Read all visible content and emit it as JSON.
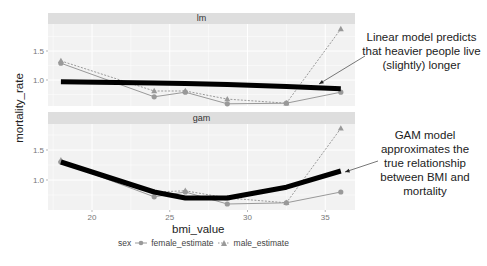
{
  "chart_data": {
    "type": "line",
    "title": "",
    "xlabel": "bmi_value",
    "ylabel": "mortality_rate",
    "x": [
      18,
      24,
      26,
      28.7,
      32.5,
      36
    ],
    "x_ticks": [
      20,
      25,
      30,
      35
    ],
    "y_ticks": [
      1.0,
      1.5
    ],
    "xlim": [
      17,
      37
    ],
    "grid": true,
    "legend": {
      "title": "sex",
      "position": "bottom",
      "entries": [
        "female_estimate",
        "male_estimate"
      ]
    },
    "facets": [
      {
        "label": "lm",
        "ylim": [
          0.55,
          1.95
        ],
        "series": [
          {
            "name": "female_estimate",
            "marker": "circle",
            "linestyle": "solid",
            "values": [
              1.29,
              0.71,
              0.79,
              0.59,
              0.6,
              0.79
            ]
          },
          {
            "name": "male_estimate",
            "marker": "triangle",
            "linestyle": "dashed",
            "values": [
              1.33,
              0.81,
              0.81,
              0.67,
              0.6,
              1.88
            ]
          },
          {
            "name": "model_fit",
            "linestyle": "thick",
            "values": [
              0.97,
              0.95,
              0.94,
              0.92,
              0.89,
              0.85
            ]
          }
        ]
      },
      {
        "label": "gam",
        "ylim": [
          0.55,
          1.95
        ],
        "series": [
          {
            "name": "female_estimate",
            "marker": "circle",
            "linestyle": "solid",
            "values": [
              1.3,
              0.72,
              0.8,
              0.6,
              0.62,
              0.8
            ]
          },
          {
            "name": "male_estimate",
            "marker": "triangle",
            "linestyle": "dashed",
            "values": [
              1.33,
              0.8,
              0.82,
              0.7,
              0.62,
              1.86
            ]
          },
          {
            "name": "model_fit",
            "linestyle": "thick",
            "values": [
              1.3,
              0.8,
              0.7,
              0.7,
              0.88,
              1.15
            ]
          }
        ]
      }
    ],
    "annotations": [
      {
        "text": "Linear model predicts that heavier people live (slightly) longer",
        "points_to": "lm fit line"
      },
      {
        "text": "GAM model approximates the true relationship between BMI and mortality",
        "points_to": "gam fit line"
      }
    ]
  },
  "labels": {
    "facet_top": "lm",
    "facet_bottom": "gam",
    "xlabel": "bmi_value",
    "ylabel": "mortality_rate",
    "legend_title": "sex",
    "legend_female": "female_estimate",
    "legend_male": "male_estimate",
    "annot_lm": "Linear model predicts that heavier people live (slightly) longer",
    "annot_gam": "GAM model approximates the true relationship between BMI and mortality"
  },
  "colors": {
    "panel_bg": "#f2f2f2",
    "strip_bg": "#dedede",
    "grid": "#ffffff",
    "points": "#999999",
    "fit": "#000000",
    "text": "#222222",
    "tick_text": "#777777"
  }
}
